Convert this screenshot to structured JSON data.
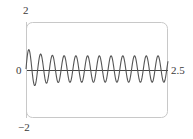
{
  "chart_data": {
    "type": "line",
    "title": "",
    "xlabel": "",
    "ylabel": "",
    "xlim": [
      0,
      2.5
    ],
    "ylim": [
      -2,
      2
    ],
    "grid": false,
    "legend": null,
    "tick_labels": {
      "y_top": "2",
      "y_bottom": "−2",
      "x_origin": "0",
      "x_end": "2.5"
    },
    "series": [
      {
        "name": "response",
        "description": "Oscillating response: small decaying transient plus steady sinusoid, ~12 cycles over [0, 2.5]",
        "model": {
          "steady_amplitude": 0.55,
          "steady_offset": 0.04,
          "frequency_cycles": 12.1,
          "transient_amplitude": 0.35,
          "transient_decay": 6.0,
          "start_value": 0.0
        },
        "sampled_points": {
          "x": [
            0.0,
            0.05,
            0.11,
            0.16,
            0.32,
            0.53,
            0.74,
            0.95,
            1.16,
            1.37,
            1.58,
            1.79,
            2.0,
            2.21,
            2.42,
            2.5
          ],
          "y": [
            0.0,
            0.87,
            0.0,
            -0.45,
            0.72,
            0.62,
            0.6,
            0.58,
            0.58,
            0.58,
            0.58,
            0.58,
            0.58,
            0.58,
            0.58,
            -0.3
          ]
        },
        "peak_values_approx": [
          0.87,
          0.72,
          0.66,
          0.62,
          0.6,
          0.59,
          0.58,
          0.58,
          0.58,
          0.58,
          0.58,
          0.58
        ],
        "trough_values_approx": [
          -0.45,
          -0.5,
          -0.52,
          -0.52,
          -0.52,
          -0.52,
          -0.52,
          -0.52,
          -0.52,
          -0.52,
          -0.52
        ],
        "color": "#555555"
      }
    ],
    "frame": {
      "border_color": "#c8c8c8",
      "corner_radius": 6,
      "axis_color": "#444444"
    }
  }
}
